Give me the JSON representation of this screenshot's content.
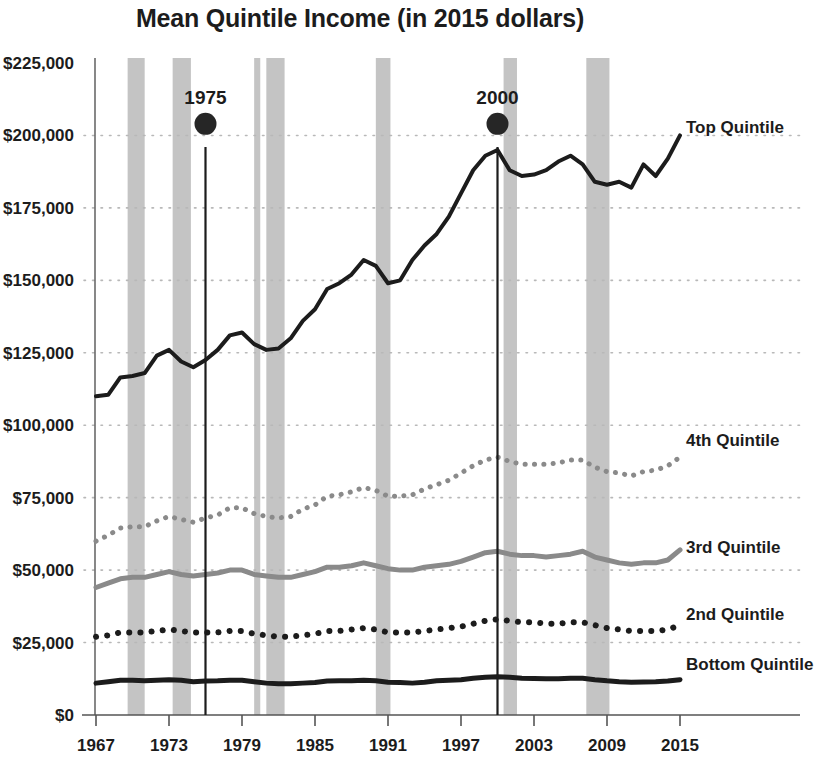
{
  "chart_data": {
    "type": "line",
    "title": "Mean Quintile Income (in 2015 dollars)",
    "xlabel": "",
    "ylabel": "",
    "xlim": [
      1967,
      2015
    ],
    "ylim": [
      0,
      225000
    ],
    "grid": true,
    "legend_position": "right-inline",
    "y_ticks": [
      "$0",
      "$25,000",
      "$50,000",
      "$75,000",
      "$100,000",
      "$125,000",
      "$150,000",
      "$175,000",
      "$200,000",
      "$225,000"
    ],
    "y_tick_values": [
      0,
      25000,
      50000,
      75000,
      100000,
      125000,
      150000,
      175000,
      200000,
      225000
    ],
    "x_ticks": [
      "1967",
      "1973",
      "1979",
      "1985",
      "1991",
      "1997",
      "2003",
      "2009",
      "2015"
    ],
    "x_tick_values": [
      1967,
      1973,
      1979,
      1985,
      1991,
      1997,
      2003,
      2009,
      2015
    ],
    "x": [
      1967,
      1968,
      1969,
      1970,
      1971,
      1972,
      1973,
      1974,
      1975,
      1976,
      1977,
      1978,
      1979,
      1980,
      1981,
      1982,
      1983,
      1984,
      1985,
      1986,
      1987,
      1988,
      1989,
      1990,
      1991,
      1992,
      1993,
      1994,
      1995,
      1996,
      1997,
      1998,
      1999,
      2000,
      2001,
      2002,
      2003,
      2004,
      2005,
      2006,
      2007,
      2008,
      2009,
      2010,
      2011,
      2012,
      2013,
      2014,
      2015
    ],
    "series": [
      {
        "name": "Top Quintile",
        "color": "#1c1c1c",
        "style": "solid",
        "width": 4,
        "label_x": 2015,
        "label_y": 203000,
        "values": [
          110000,
          110500,
          116500,
          117000,
          118000,
          124000,
          126000,
          122000,
          120000,
          122500,
          126000,
          131000,
          132000,
          128000,
          126000,
          126500,
          130000,
          136000,
          140000,
          147000,
          149000,
          152000,
          157000,
          155000,
          149000,
          150000,
          157000,
          162000,
          166000,
          172000,
          180000,
          188000,
          193000,
          195000,
          188000,
          186000,
          186500,
          188000,
          191000,
          193000,
          190000,
          184000,
          183000,
          184000,
          182000,
          190000,
          186000,
          192000,
          200000
        ]
      },
      {
        "name": "4th Quintile",
        "color": "#8a8a8a",
        "style": "dotted",
        "width": 5,
        "label_x": 2015,
        "label_y": 95000,
        "values": [
          60000,
          62000,
          64500,
          65000,
          65000,
          67000,
          68500,
          67500,
          66500,
          68000,
          69000,
          71500,
          71500,
          69500,
          68500,
          68000,
          68500,
          71000,
          72500,
          75500,
          76000,
          77000,
          78500,
          77500,
          75500,
          75500,
          76000,
          78000,
          79500,
          81000,
          83500,
          86000,
          88000,
          89000,
          87500,
          86500,
          86500,
          86500,
          87000,
          88000,
          88000,
          85500,
          84000,
          83500,
          82500,
          84000,
          84500,
          86000,
          89000
        ]
      },
      {
        "name": "3rd Quintile",
        "color": "#8a8a8a",
        "style": "solid",
        "width": 5,
        "label_x": 2015,
        "label_y": 58000,
        "values": [
          44000,
          45500,
          47000,
          47500,
          47500,
          48500,
          49500,
          48500,
          48000,
          48500,
          49000,
          50000,
          50000,
          48500,
          48000,
          47500,
          47500,
          48500,
          49500,
          51000,
          51000,
          51500,
          52500,
          51500,
          50500,
          50000,
          50000,
          51000,
          51500,
          52000,
          53000,
          54500,
          56000,
          56500,
          55500,
          55000,
          55000,
          54500,
          55000,
          55500,
          56500,
          54500,
          53500,
          52500,
          52000,
          52500,
          52500,
          53500,
          57000
        ]
      },
      {
        "name": "2nd Quintile",
        "color": "#1c1c1c",
        "style": "dotted",
        "width": 6,
        "label_x": 2015,
        "label_y": 35000,
        "values": [
          27000,
          27500,
          28500,
          28500,
          28500,
          29000,
          29500,
          29000,
          28500,
          28500,
          28500,
          29000,
          29000,
          28000,
          27500,
          27000,
          27000,
          27500,
          28000,
          29000,
          29000,
          29500,
          30000,
          29500,
          28500,
          28500,
          28500,
          29000,
          29500,
          30000,
          30500,
          31500,
          32500,
          33000,
          32500,
          32000,
          32000,
          31500,
          31500,
          32000,
          32000,
          31000,
          30000,
          29500,
          29000,
          29000,
          29000,
          29500,
          31000
        ]
      },
      {
        "name": "Bottom Quintile",
        "color": "#1c1c1c",
        "style": "solid",
        "width": 5,
        "label_x": 2015,
        "label_y": 17500,
        "values": [
          11000,
          11500,
          12000,
          12000,
          11800,
          12000,
          12200,
          12000,
          11500,
          11700,
          11800,
          12000,
          12000,
          11500,
          11000,
          10800,
          10800,
          11000,
          11200,
          11700,
          11800,
          11800,
          12000,
          11800,
          11300,
          11200,
          11000,
          11300,
          11800,
          12000,
          12200,
          12700,
          13000,
          13200,
          13000,
          12700,
          12600,
          12500,
          12500,
          12700,
          12700,
          12200,
          11800,
          11500,
          11300,
          11400,
          11500,
          11700,
          12200
        ]
      }
    ],
    "annotations": [
      {
        "label": "1975",
        "x": 1976,
        "marker_y": 204000,
        "line_top_y": 196000,
        "line_bottom_y": 0
      },
      {
        "label": "2000",
        "x": 2000,
        "marker_y": 204000,
        "line_top_y": 196000,
        "line_bottom_y": 0
      }
    ],
    "recession_bands": [
      {
        "start": 1969.6,
        "end": 1971.0
      },
      {
        "start": 1973.3,
        "end": 1974.8
      },
      {
        "start": 1980.0,
        "end": 1980.5
      },
      {
        "start": 1981.0,
        "end": 1982.5
      },
      {
        "start": 1990.0,
        "end": 1991.2
      },
      {
        "start": 2000.5,
        "end": 2001.6
      },
      {
        "start": 2007.3,
        "end": 2009.2
      }
    ],
    "recession_band_color": "#c4c4c4",
    "grid_color": "#b8b8b8",
    "axis_color": "#555555"
  }
}
